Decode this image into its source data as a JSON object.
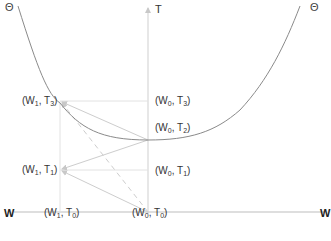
{
  "diagram": {
    "curve_label_left": "Θ",
    "curve_label_right": "Θ",
    "vertical_axis_label": "T",
    "horizontal_axis_label_left": "W",
    "horizontal_axis_label_right": "W",
    "points": [
      {
        "id": "w1t3",
        "w": "W",
        "w_sub": "1",
        "t": "T",
        "t_sub": "3"
      },
      {
        "id": "w0t3",
        "w": "W",
        "w_sub": "0",
        "t": "T",
        "t_sub": "3"
      },
      {
        "id": "w0t2",
        "w": "W",
        "w_sub": "0",
        "t": "T",
        "t_sub": "2"
      },
      {
        "id": "w1t1",
        "w": "W",
        "w_sub": "1",
        "t": "T",
        "t_sub": "1"
      },
      {
        "id": "w0t1",
        "w": "W",
        "w_sub": "0",
        "t": "T",
        "t_sub": "1"
      },
      {
        "id": "w1t0",
        "w": "W",
        "w_sub": "1",
        "t": "T",
        "t_sub": "0"
      },
      {
        "id": "w0t0",
        "w": "W",
        "w_sub": "0",
        "t": "T",
        "t_sub": "0"
      }
    ],
    "colors": {
      "curve": "#888888",
      "grid": "#dddddd",
      "arrows": "#cccccc",
      "axis": "#bbbbbb"
    }
  }
}
